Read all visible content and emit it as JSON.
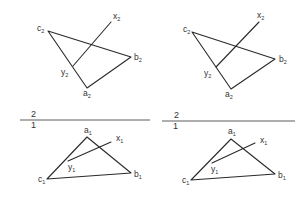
{
  "diagram": {
    "panels": [
      {
        "id": "left",
        "upper_view": {
          "triangle_points": {
            "c2": [
              48,
              31
            ],
            "b2": [
              131,
              57
            ],
            "a2": [
              87,
              88
            ]
          },
          "line_points": {
            "x2": [
              111,
              22
            ],
            "y2": [
              73,
              66
            ]
          },
          "labels": {
            "c": {
              "base": "c",
              "sub": "2"
            },
            "b": {
              "base": "b",
              "sub": "2"
            },
            "a": {
              "base": "a",
              "sub": "2"
            },
            "x": {
              "base": "x",
              "sub": "2"
            },
            "y": {
              "base": "y",
              "sub": "2"
            }
          }
        },
        "axis": {
          "x1": 20,
          "x2": 150,
          "y": 120,
          "top_label": "2",
          "bottom_label": "1"
        },
        "lower_view": {
          "triangle_points": {
            "a1": [
              87,
              137
            ],
            "b1": [
              131,
              173
            ],
            "c1": [
              47,
              179
            ]
          },
          "line_points": {
            "x1": [
              111,
              142
            ],
            "y1": [
              68,
              161
            ]
          },
          "labels": {
            "a": {
              "base": "a",
              "sub": "1"
            },
            "b": {
              "base": "b",
              "sub": "1"
            },
            "c": {
              "base": "c",
              "sub": "1"
            },
            "x": {
              "base": "x",
              "sub": "1"
            },
            "y": {
              "base": "y",
              "sub": "1"
            }
          }
        }
      },
      {
        "id": "right",
        "upper_view": {
          "triangle_points": {
            "c2": [
              192,
              32
            ],
            "b2": [
              275,
              59
            ],
            "a2": [
              231,
              89
            ]
          },
          "line_points": {
            "x2": [
              259,
              22
            ],
            "y2": [
              216,
              67
            ]
          },
          "labels": {
            "c": {
              "base": "c",
              "sub": "2"
            },
            "b": {
              "base": "b",
              "sub": "2"
            },
            "a": {
              "base": "a",
              "sub": "2"
            },
            "x": {
              "base": "x",
              "sub": "2"
            },
            "y": {
              "base": "y",
              "sub": "2"
            }
          }
        },
        "axis": {
          "x1": 162,
          "x2": 295,
          "y": 121,
          "top_label": "2",
          "bottom_label": "1"
        },
        "lower_view": {
          "triangle_points": {
            "a1": [
              231,
              139
            ],
            "b1": [
              275,
              174
            ],
            "c1": [
              191,
              180
            ]
          },
          "line_points": {
            "x1": [
              255,
              143
            ],
            "y1": [
              212,
              163
            ]
          },
          "labels": {
            "a": {
              "base": "a",
              "sub": "1"
            },
            "b": {
              "base": "b",
              "sub": "1"
            },
            "c": {
              "base": "c",
              "sub": "1"
            },
            "x": {
              "base": "x",
              "sub": "1"
            },
            "y": {
              "base": "y",
              "sub": "1"
            }
          }
        }
      }
    ]
  }
}
